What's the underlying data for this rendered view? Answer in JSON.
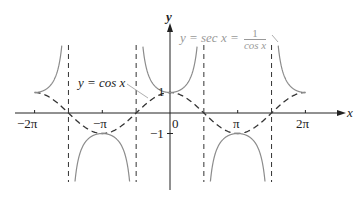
{
  "chart_data": {
    "type": "line",
    "title": "",
    "xlabel": "x",
    "ylabel": "y",
    "xlim": [
      -6.283,
      6.283
    ],
    "ylim": [
      -3.5,
      3.5
    ],
    "grid": false,
    "x_ticks": [
      "-2π",
      "-π",
      "0",
      "π",
      "2π"
    ],
    "y_ticks": [
      "1",
      "-1"
    ],
    "asymptotes": [
      "-3π/2",
      "-π/2",
      "π/2",
      "3π/2"
    ],
    "series": [
      {
        "name": "y = cos x",
        "style": "dashed",
        "color": "#333333",
        "function": "cos(x)"
      },
      {
        "name": "y = sec x = 1/cos x",
        "style": "solid",
        "color": "#8c8c8c",
        "function": "1/cos(x)"
      }
    ],
    "annotations": [
      {
        "text": "y = cos x",
        "points_to": "cos curve near x=-π/4"
      },
      {
        "text": "y = sec x = 1/cos x",
        "points_to": "sec branch near x=3π/2"
      }
    ]
  },
  "labels": {
    "x_axis": "x",
    "y_axis": "y",
    "tick_neg2pi": "−2π",
    "tick_negpi": "−π",
    "tick_zero": "0",
    "tick_pi": "π",
    "tick_2pi": "2π",
    "tick_y1": "1",
    "tick_yneg1": "−1",
    "cos_label": "y = cos x",
    "sec_label_lhs": "y = sec x =",
    "sec_num": "1",
    "sec_den": "cos x"
  }
}
